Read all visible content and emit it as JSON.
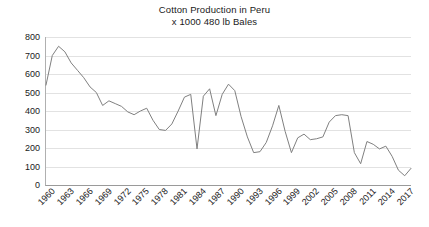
{
  "chart_data": {
    "type": "line",
    "title": "Cotton Production in Peru",
    "subtitle": "x 1000 480 lb Bales",
    "xlabel": "",
    "ylabel": "",
    "ylim": [
      0,
      800
    ],
    "ytick_step": 100,
    "yticks": [
      0,
      100,
      200,
      300,
      400,
      500,
      600,
      700,
      800
    ],
    "xlim": [
      1960,
      2018
    ],
    "xtick_step": 3,
    "xticks": [
      1960,
      1963,
      1966,
      1969,
      1972,
      1975,
      1978,
      1981,
      1984,
      1987,
      1990,
      1993,
      1996,
      1999,
      2002,
      2005,
      2008,
      2011,
      2014,
      2017
    ],
    "grid": "horizontal",
    "legend": "none",
    "line_color": "#808080",
    "x": [
      1960,
      1961,
      1962,
      1963,
      1964,
      1965,
      1966,
      1967,
      1968,
      1969,
      1970,
      1971,
      1972,
      1973,
      1974,
      1975,
      1976,
      1977,
      1978,
      1979,
      1980,
      1981,
      1982,
      1983,
      1984,
      1985,
      1986,
      1987,
      1988,
      1989,
      1990,
      1991,
      1992,
      1993,
      1994,
      1995,
      1996,
      1997,
      1998,
      1999,
      2000,
      2001,
      2002,
      2003,
      2004,
      2005,
      2006,
      2007,
      2008,
      2009,
      2010,
      2011,
      2012,
      2013,
      2014,
      2015,
      2016,
      2017,
      2018
    ],
    "values": [
      540,
      700,
      750,
      720,
      660,
      620,
      580,
      530,
      500,
      430,
      455,
      440,
      425,
      395,
      380,
      400,
      415,
      350,
      300,
      295,
      330,
      400,
      475,
      490,
      195,
      480,
      520,
      375,
      490,
      545,
      510,
      370,
      260,
      175,
      180,
      230,
      320,
      430,
      290,
      175,
      255,
      275,
      245,
      250,
      260,
      340,
      375,
      380,
      375,
      175,
      115,
      235,
      220,
      195,
      210,
      155,
      80,
      50,
      90
    ],
    "series": [
      {
        "name": "Cotton Production",
        "values": [
          540,
          700,
          750,
          720,
          660,
          620,
          580,
          530,
          500,
          430,
          455,
          440,
          425,
          395,
          380,
          400,
          415,
          350,
          300,
          295,
          330,
          400,
          475,
          490,
          195,
          480,
          520,
          375,
          490,
          545,
          510,
          370,
          260,
          175,
          180,
          230,
          320,
          430,
          290,
          175,
          255,
          275,
          245,
          250,
          260,
          340,
          375,
          380,
          375,
          175,
          115,
          235,
          220,
          195,
          210,
          155,
          80,
          50,
          90
        ]
      }
    ]
  }
}
